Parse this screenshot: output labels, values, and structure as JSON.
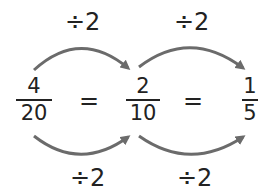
{
  "fractions": [
    {
      "numerator": "4",
      "denominator": "20"
    },
    {
      "numerator": "2",
      "denominator": "10"
    },
    {
      "numerator": "1",
      "denominator": "5"
    }
  ],
  "equals": [
    "=",
    "="
  ],
  "top_labels": [
    "÷2",
    "÷2"
  ],
  "bottom_labels": [
    "÷2",
    "÷2"
  ],
  "colors": {
    "arrow": "#6b6b6b",
    "text": "#222222"
  }
}
